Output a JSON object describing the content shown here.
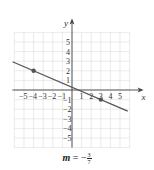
{
  "chart_data": {
    "type": "line",
    "title": "",
    "xlabel": "x",
    "ylabel": "y",
    "xlim": [
      -6,
      6
    ],
    "ylim": [
      -6,
      6
    ],
    "grid": true,
    "x_ticks": [
      -5,
      -4,
      -3,
      -2,
      -1,
      1,
      2,
      3,
      4,
      5
    ],
    "y_ticks": [
      5,
      4,
      3,
      2,
      1,
      -1,
      -2,
      -3,
      -4,
      -5
    ],
    "series": [
      {
        "name": "line",
        "slope_num": -3,
        "slope_den": 7,
        "points": [
          {
            "x": -4,
            "y": 2
          },
          {
            "x": 3,
            "y": -1
          }
        ],
        "color": "#555555"
      }
    ],
    "annotation": "m = -3/7"
  },
  "caption": {
    "var": "m",
    "eq": " = −",
    "num": "3",
    "den": "7"
  },
  "labels": {
    "x": "x",
    "y": "y"
  }
}
